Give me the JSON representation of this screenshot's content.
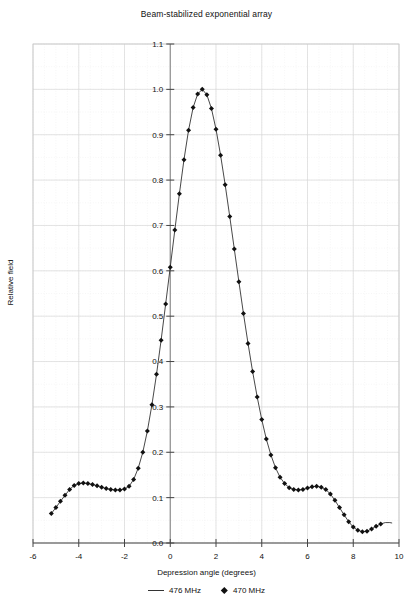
{
  "chart_data": {
    "type": "line",
    "title": "Beam-stabilized exponential array",
    "xlabel": "Depression angle (degrees)",
    "ylabel": "Relative field",
    "xlim": [
      -6,
      10
    ],
    "ylim": [
      0.0,
      1.1
    ],
    "xticks": [
      -6,
      -4,
      -2,
      0,
      2,
      4,
      6,
      8,
      10
    ],
    "yticks": [
      0.0,
      0.1,
      0.2,
      0.3,
      0.4,
      0.5,
      0.6,
      0.7,
      0.8,
      0.9,
      1.0,
      1.1
    ],
    "xtick_labels": [
      "-6",
      "-4",
      "-2",
      "0",
      "2",
      "4",
      "6",
      "8",
      "10"
    ],
    "ytick_labels": [
      "0.0",
      "0.1",
      "0.2",
      "0.3",
      "0.4",
      "0.5",
      "0.6",
      "0.7",
      "0.8",
      "0.9",
      "1.0",
      "1.1"
    ],
    "grid": true,
    "minor_grid": true,
    "legend_position": "below",
    "line_color": "#333333",
    "marker_color": "#111111",
    "grid_color": "#d8d8d8",
    "series": [
      {
        "name": "476 MHz",
        "style": "line",
        "x": [
          -5.2,
          -5.0,
          -4.8,
          -4.6,
          -4.4,
          -4.2,
          -4.0,
          -3.8,
          -3.6,
          -3.4,
          -3.2,
          -3.0,
          -2.8,
          -2.6,
          -2.4,
          -2.2,
          -2.0,
          -1.8,
          -1.6,
          -1.4,
          -1.2,
          -1.0,
          -0.8,
          -0.6,
          -0.4,
          -0.2,
          0.0,
          0.2,
          0.4,
          0.6,
          0.8,
          1.0,
          1.2,
          1.4,
          1.6,
          1.8,
          2.0,
          2.2,
          2.4,
          2.6,
          2.8,
          3.0,
          3.2,
          3.4,
          3.6,
          3.8,
          4.0,
          4.2,
          4.4,
          4.6,
          4.8,
          5.0,
          5.2,
          5.4,
          5.6,
          5.8,
          6.0,
          6.2,
          6.4,
          6.6,
          6.8,
          7.0,
          7.2,
          7.4,
          7.6,
          7.8,
          8.0,
          8.2,
          8.4,
          8.6,
          8.8,
          9.0,
          9.2,
          9.4,
          9.6,
          9.7
        ],
        "y": [
          0.065,
          0.078,
          0.092,
          0.105,
          0.118,
          0.127,
          0.131,
          0.132,
          0.131,
          0.129,
          0.126,
          0.123,
          0.12,
          0.118,
          0.117,
          0.117,
          0.119,
          0.125,
          0.14,
          0.165,
          0.2,
          0.247,
          0.305,
          0.372,
          0.447,
          0.527,
          0.608,
          0.69,
          0.77,
          0.845,
          0.91,
          0.96,
          0.99,
          1.0,
          0.988,
          0.958,
          0.912,
          0.855,
          0.79,
          0.72,
          0.648,
          0.576,
          0.506,
          0.44,
          0.378,
          0.322,
          0.272,
          0.229,
          0.194,
          0.166,
          0.145,
          0.131,
          0.122,
          0.118,
          0.117,
          0.118,
          0.121,
          0.124,
          0.125,
          0.123,
          0.118,
          0.108,
          0.094,
          0.078,
          0.062,
          0.047,
          0.035,
          0.028,
          0.025,
          0.026,
          0.031,
          0.037,
          0.042,
          0.045,
          0.045,
          0.044
        ]
      },
      {
        "name": "470 MHz",
        "style": "markers",
        "x": [
          -5.2,
          -5.0,
          -4.8,
          -4.6,
          -4.4,
          -4.2,
          -4.0,
          -3.8,
          -3.6,
          -3.4,
          -3.2,
          -3.0,
          -2.8,
          -2.6,
          -2.4,
          -2.2,
          -2.0,
          -1.8,
          -1.6,
          -1.4,
          -1.2,
          -1.0,
          -0.8,
          -0.6,
          -0.4,
          -0.2,
          0.0,
          0.2,
          0.4,
          0.6,
          0.8,
          1.0,
          1.2,
          1.4,
          1.6,
          1.8,
          2.0,
          2.2,
          2.4,
          2.6,
          2.8,
          3.0,
          3.2,
          3.4,
          3.6,
          3.8,
          4.0,
          4.2,
          4.4,
          4.6,
          4.8,
          5.0,
          5.2,
          5.4,
          5.6,
          5.8,
          6.0,
          6.2,
          6.4,
          6.6,
          6.8,
          7.0,
          7.2,
          7.4,
          7.6,
          7.8,
          8.0,
          8.2,
          8.4,
          8.6,
          8.8,
          9.0,
          9.2
        ],
        "y": [
          0.065,
          0.078,
          0.092,
          0.105,
          0.118,
          0.127,
          0.131,
          0.132,
          0.131,
          0.129,
          0.126,
          0.123,
          0.12,
          0.118,
          0.117,
          0.117,
          0.119,
          0.125,
          0.14,
          0.165,
          0.2,
          0.247,
          0.305,
          0.372,
          0.447,
          0.527,
          0.608,
          0.69,
          0.77,
          0.845,
          0.91,
          0.96,
          0.99,
          1.0,
          0.988,
          0.958,
          0.912,
          0.855,
          0.79,
          0.72,
          0.648,
          0.576,
          0.506,
          0.44,
          0.378,
          0.322,
          0.272,
          0.229,
          0.194,
          0.166,
          0.145,
          0.131,
          0.122,
          0.118,
          0.117,
          0.118,
          0.121,
          0.124,
          0.125,
          0.123,
          0.118,
          0.108,
          0.094,
          0.078,
          0.062,
          0.047,
          0.035,
          0.028,
          0.025,
          0.026,
          0.031,
          0.037,
          0.042
        ]
      }
    ]
  },
  "legend": {
    "items": [
      {
        "label": "476 MHz",
        "marker": "line"
      },
      {
        "label": "470 MHz",
        "marker": "diamond"
      }
    ]
  }
}
